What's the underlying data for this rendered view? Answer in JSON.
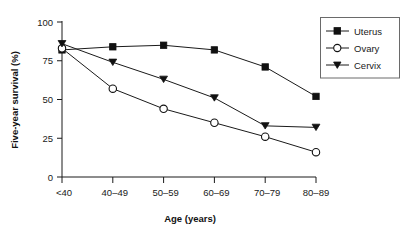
{
  "chart_data": {
    "type": "line",
    "title": "",
    "xlabel": "Age (years)",
    "ylabel": "Five-year survival (%)",
    "categories": [
      "<40",
      "40–49",
      "50–59",
      "60–69",
      "70–79",
      "80–89"
    ],
    "xtick_labels": [
      "<40",
      "40–49",
      "50–59",
      "60–69",
      "70–79",
      "80–89"
    ],
    "ytick_labels": [
      "0",
      "25",
      "50",
      "75",
      "100"
    ],
    "ytick_values": [
      0,
      25,
      50,
      75,
      100
    ],
    "ylim": [
      0,
      100
    ],
    "grid": false,
    "legend_position": "top-right",
    "series": [
      {
        "name": "Uterus",
        "marker": "filled-square",
        "values": [
          82,
          84,
          85,
          82,
          71,
          52
        ]
      },
      {
        "name": "Ovary",
        "marker": "open-circle",
        "values": [
          83,
          57,
          44,
          35,
          26,
          16
        ]
      },
      {
        "name": "Cervix",
        "marker": "filled-triangle-down",
        "values": [
          86,
          74,
          63,
          51,
          33,
          32
        ]
      }
    ],
    "colors": {
      "line": "#1a1a1a",
      "marker_fill": "#111111",
      "marker_open_fill": "#ffffff",
      "axis": "#1a1a1a",
      "legend_border": "#6a6a6a",
      "background": "#ffffff"
    }
  },
  "legend": {
    "entries": [
      {
        "label": "Uterus"
      },
      {
        "label": "Ovary"
      },
      {
        "label": "Cervix"
      }
    ]
  },
  "axes": {
    "y_title": "Five-year survival (%)",
    "x_title": "Age (years)"
  }
}
